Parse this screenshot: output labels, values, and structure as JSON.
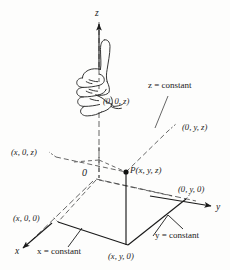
{
  "figure": {
    "background_color": "#fdfdfc",
    "ink_color": "#1a1a1a"
  },
  "axes": [
    {
      "name": "z",
      "label": "z",
      "direction": "up"
    },
    {
      "name": "y",
      "label": "y",
      "direction": "right"
    },
    {
      "name": "x",
      "label": "x",
      "direction": "lower-left"
    }
  ],
  "point_labels": {
    "origin": "0",
    "point_p": "P(x, y, z)",
    "on_z_axis": "(0, 0, z)",
    "yz_plane": "(0, y, z)",
    "xz_plane": "(x, 0, z)",
    "on_y_axis": "(0, y, 0)",
    "on_x_axis": "(x, 0, 0)",
    "xy_plane": "(x, y, 0)"
  },
  "plane_labels": {
    "z_constant": "z = constant",
    "y_constant": "y = constant",
    "x_constant": "x = constant"
  },
  "icons": {
    "hand": "right-hand-thumbs-up-icon"
  }
}
